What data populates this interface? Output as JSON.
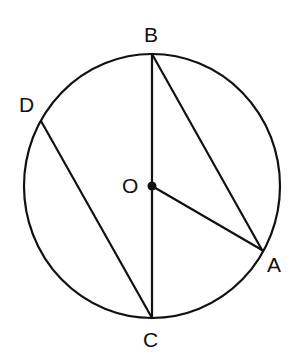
{
  "diagram": {
    "type": "circle-geometry",
    "colors": {
      "stroke": "#111111",
      "background": "#ffffff"
    },
    "circle": {
      "center": "O",
      "cx": 152,
      "cy": 186,
      "rx": 128,
      "ry": 132
    },
    "points": {
      "B": {
        "label": "B",
        "x": 152,
        "y": 54
      },
      "C": {
        "label": "C",
        "x": 152,
        "y": 318
      },
      "O": {
        "label": "O",
        "x": 152,
        "y": 186
      },
      "A": {
        "label": "A",
        "x": 262,
        "y": 250
      },
      "D": {
        "label": "D",
        "x": 41,
        "y": 121
      }
    },
    "segments": [
      {
        "name": "BC",
        "from": "B",
        "to": "C",
        "note": "diameter"
      },
      {
        "name": "BA",
        "from": "B",
        "to": "A"
      },
      {
        "name": "OA",
        "from": "O",
        "to": "A",
        "note": "radius"
      },
      {
        "name": "DC",
        "from": "D",
        "to": "C"
      }
    ]
  }
}
